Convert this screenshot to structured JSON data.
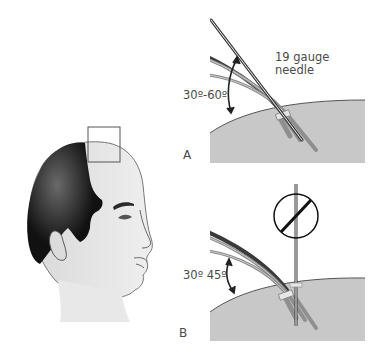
{
  "figure": {
    "colors": {
      "background": "#ffffff",
      "scalp_fill": "#c8c8c8",
      "scalp_outline": "#555555",
      "hair_dark": "#3a3a3a",
      "hair_light": "#8a8a8a",
      "skin": "#e6e6e6",
      "head_hair": "#111111",
      "text": "#4a4a4a"
    }
  },
  "head": {
    "description": "Profile view of balding male head with a square highlighting the frontal hairline region"
  },
  "panels": [
    {
      "id": "A",
      "label": "A",
      "angle_label": "30º-60º",
      "needle_label": "19 gauge needle",
      "needle_orientation": "angled (correct)"
    },
    {
      "id": "B",
      "label": "B",
      "angle_label": "30º 45º",
      "needle_orientation": "perpendicular (prohibited)",
      "prohibited_symbol": true
    }
  ]
}
